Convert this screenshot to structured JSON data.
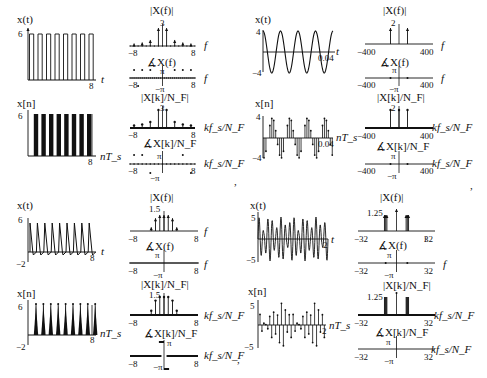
{
  "figure": {
    "separators": [
      ",",
      ",",
      ",",
      ""
    ]
  },
  "panels": [
    {
      "id": "square-wave",
      "time_cont": {
        "title": "x(t)",
        "xlabel": "t",
        "ymax_label": "6",
        "xmax_label": "8",
        "ymin_label": ""
      },
      "time_disc": {
        "title": "x[n]",
        "xlabel": "nT_s",
        "ymax_label": "6",
        "xmax_label": "8"
      },
      "mag_cont": {
        "title": "|X(f)|",
        "xlabel": "f",
        "peak_label": "3",
        "xmin_label": "−8",
        "xmax_label": "8"
      },
      "phase_cont": {
        "title": "∡X(f)",
        "xlabel": "f",
        "pi_label": "π",
        "negpi_label": "−π",
        "xmin_label": "−8",
        "xmax_label": "8"
      },
      "mag_disc": {
        "title": "|X[k]/N_F|",
        "xlabel": "kf_s/N_F",
        "peak_label": "3",
        "xmin_label": "−8",
        "xmax_label": "8"
      },
      "phase_disc": {
        "title": "∡X[k]/N_F",
        "xlabel": "kf_s/N_F",
        "pi_label": "π",
        "negpi_label": "−π",
        "xmin_label": "−8",
        "xmax_label": "8"
      }
    },
    {
      "id": "sinusoid",
      "time_cont": {
        "title": "x(t)",
        "xlabel": "t",
        "ymax_label": "4",
        "ymin_label": "−4",
        "xmax_label": "0.04"
      },
      "time_disc": {
        "title": "x[n]",
        "xlabel": "nT_s",
        "ymax_label": "4",
        "ymin_label": "−4",
        "xmax_label": "0.04"
      },
      "mag_cont": {
        "title": "|X(f)|",
        "xlabel": "f",
        "peak_label": "2",
        "xmin_label": "−400",
        "xmax_label": "400"
      },
      "phase_cont": {
        "title": "∡X(f)",
        "xlabel": "f",
        "pi_label": "π",
        "negpi_label": "−π",
        "xmin_label": "−400",
        "xmax_label": "400"
      },
      "mag_disc": {
        "title": "|X[k]/N_F|",
        "xlabel": "kf_s/N_F",
        "peak_label": "2",
        "xmin_label": "−400",
        "xmax_label": "400"
      },
      "phase_disc": {
        "title": "∡X[k]/N_F",
        "xlabel": "kf_s/N_F",
        "pi_label": "π",
        "negpi_label": "−π",
        "xmin_label": "−400",
        "xmax_label": "400"
      }
    },
    {
      "id": "triangle-wave",
      "time_cont": {
        "title": "x(t)",
        "xlabel": "t",
        "ymax_label": "6",
        "ymin_label": "−2",
        "xmax_label": "8"
      },
      "time_disc": {
        "title": "x[n]",
        "xlabel": "nT_s",
        "ymax_label": "6",
        "ymin_label": "−2",
        "xmax_label": "8"
      },
      "mag_cont": {
        "title": "|X(f)|",
        "xlabel": "f",
        "peak_label": "1.5",
        "xmin_label": "−8",
        "xmax_label": "8"
      },
      "phase_cont": {
        "title": "∡X(f)",
        "xlabel": "f",
        "pi_label": "π",
        "negpi_label": "−π",
        "xmin_label": "−8",
        "xmax_label": "8"
      },
      "mag_disc": {
        "title": "|X[k]/N_F|",
        "xlabel": "kf_s/N_F",
        "peak_label": "1.5",
        "xmin_label": "−8",
        "xmax_label": "8"
      },
      "phase_disc": {
        "title": "∡X[k]/N_F",
        "xlabel": "kf_s/N_F",
        "pi_label": "π",
        "negpi_label": "−π",
        "xmin_label": "−8",
        "xmax_label": "8"
      }
    },
    {
      "id": "am-signal",
      "time_cont": {
        "title": "x(t)",
        "xlabel": "t",
        "ymax_label": "5",
        "ymin_label": "−5",
        "xmax_label": "2"
      },
      "time_disc": {
        "title": "x[n]",
        "xlabel": "nT_s",
        "ymax_label": "5",
        "ymin_label": "−5",
        "xmax_label": "2"
      },
      "mag_cont": {
        "title": "|X(f)|",
        "xlabel": "f",
        "peak_label": "1.25",
        "xmin_label": "−32",
        "xmax_label": "32"
      },
      "phase_cont": {
        "title": "∡X(f)",
        "xlabel": "f",
        "pi_label": "π",
        "negpi_label": "−π",
        "xmin_label": "−32",
        "xmax_label": "32"
      },
      "mag_disc": {
        "title": "|X[k]/N_F|",
        "xlabel": "kf_s/N_F",
        "peak_label": "1.25",
        "xmin_label": "−32",
        "xmax_label": "32"
      },
      "phase_disc": {
        "title": "∡X[k]/N_F",
        "xlabel": "kf_s/N_F",
        "pi_label": "π",
        "negpi_label": "−π",
        "xmin_label": "−32",
        "xmax_label": "32"
      }
    }
  ],
  "chart_data": [
    {
      "panel": "square-wave",
      "type": "line",
      "title": "x(t)",
      "xlabel": "t",
      "xlim": [
        0,
        8
      ],
      "ylim": [
        0,
        6
      ],
      "description": "Square pulse train, amplitude 6, period 1, duty 50%"
    },
    {
      "panel": "square-wave",
      "type": "bar",
      "title": "|X(f)|",
      "xlabel": "f",
      "xlim": [
        -8,
        8
      ],
      "x": [
        -7,
        -5,
        -3,
        -1,
        0,
        1,
        3,
        5,
        7
      ],
      "values": [
        0.27,
        0.38,
        0.64,
        1.91,
        3,
        1.91,
        0.64,
        0.38,
        0.27
      ]
    },
    {
      "panel": "sinusoid",
      "type": "line",
      "title": "x(t)",
      "xlabel": "t",
      "xlim": [
        0,
        0.04
      ],
      "ylim": [
        -4,
        4
      ],
      "description": "Cosine, amplitude 4, 4 cycles in 0.04 s (100 Hz)"
    },
    {
      "panel": "sinusoid",
      "type": "bar",
      "title": "|X(f)|",
      "xlabel": "f",
      "xlim": [
        -400,
        400
      ],
      "x": [
        -100,
        100
      ],
      "values": [
        2,
        2
      ]
    },
    {
      "panel": "triangle-wave",
      "type": "line",
      "title": "x(t)",
      "xlabel": "t",
      "xlim": [
        0,
        8
      ],
      "ylim": [
        -2,
        6
      ],
      "description": "Triangle pulse train, peak 6, period 1"
    },
    {
      "panel": "triangle-wave",
      "type": "bar",
      "title": "|X(f)|",
      "xlabel": "f",
      "xlim": [
        -8,
        8
      ],
      "x": [
        -3,
        -2,
        -1,
        0,
        1,
        2,
        3
      ],
      "values": [
        0.35,
        1.2,
        1.5,
        1.5,
        1.5,
        1.2,
        0.35
      ]
    },
    {
      "panel": "am-signal",
      "type": "line",
      "title": "x(t)",
      "xlabel": "t",
      "xlim": [
        0,
        2
      ],
      "ylim": [
        -5,
        5
      ],
      "description": "Amplitude-modulated sinusoid"
    },
    {
      "panel": "am-signal",
      "type": "bar",
      "title": "|X(f)|",
      "xlabel": "f",
      "xlim": [
        -32,
        32
      ],
      "x": [
        -9,
        -8,
        -7,
        0,
        7,
        8,
        9
      ],
      "values": [
        1.25,
        1.25,
        1.25,
        1.5,
        1.25,
        1.25,
        1.25
      ]
    }
  ]
}
